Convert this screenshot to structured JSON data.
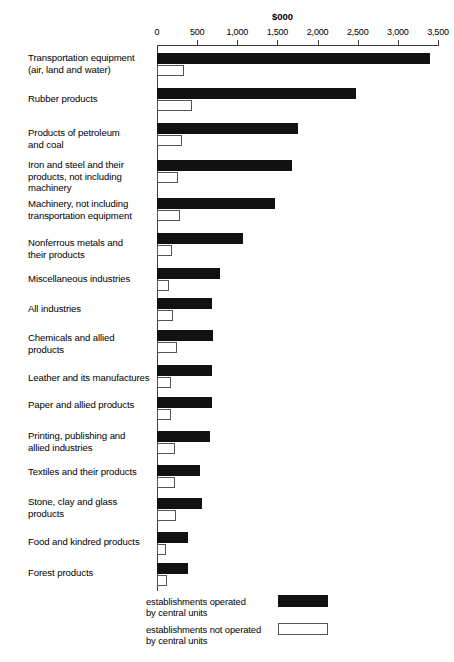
{
  "chart_data": {
    "type": "bar",
    "title": "",
    "axis_title": "$000",
    "orientation": "horizontal",
    "grid": false,
    "xlabel": "$000",
    "ylabel": "",
    "xlim": [
      0,
      3500
    ],
    "xticks": [
      0,
      500,
      1000,
      1500,
      2000,
      2500,
      3000,
      3500
    ],
    "xtick_labels": [
      "0",
      "500",
      "1,000",
      "1,500",
      "2,000",
      "2,500",
      "3,000",
      "3,500"
    ],
    "legend_position": "bottom",
    "series": [
      {
        "name": "establishments operated\nby central units",
        "key": "operated",
        "color": "#111111",
        "values": [
          3400,
          2480,
          1750,
          1680,
          1470,
          1070,
          780,
          680,
          700,
          680,
          690,
          660,
          540,
          560,
          390,
          390
        ]
      },
      {
        "name": "establishments not operated\nby central units",
        "key": "not_operated",
        "color": "#ffffff",
        "values": [
          340,
          430,
          310,
          260,
          290,
          190,
          150,
          200,
          250,
          180,
          180,
          230,
          230,
          240,
          110,
          130
        ]
      }
    ],
    "categories": [
      "Transportation equipment\n(air, land and water)",
      "Rubber products",
      "Products of petroleum\nand coal",
      "Iron and steel and their\nproducts, not including\nmachinery",
      "Machinery, not including\ntransportation equipment",
      "Nonferrous metals and\ntheir products",
      "Miscellaneous industries",
      "All industries",
      "Chemicals and allied\nproducts",
      "Leather and its manufactures",
      "Paper and allied products",
      "Printing, publishing and\nallied industries",
      "Textiles and their products",
      "Stone, clay and glass\nproducts",
      "Food and kindred products",
      "Forest products"
    ]
  },
  "legend": {
    "items": [
      {
        "label": "establishments operated\nby central units",
        "swatch": "dark"
      },
      {
        "label": "establishments not operated\nby central units",
        "swatch": "light"
      }
    ]
  }
}
